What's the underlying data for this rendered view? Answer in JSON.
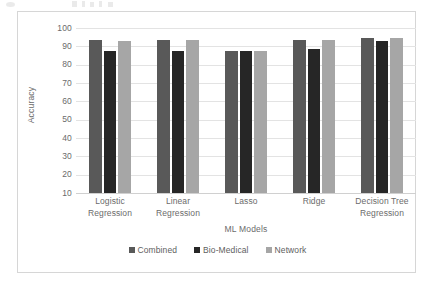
{
  "chart_data": {
    "type": "bar",
    "title": "",
    "xlabel": "ML Models",
    "ylabel": "Accuracy",
    "ylim": [
      10,
      100
    ],
    "yticks": [
      100,
      90,
      80,
      70,
      60,
      50,
      40,
      30,
      20,
      10
    ],
    "grid": true,
    "legend_position": "bottom",
    "categories": [
      "Logistic Regression",
      "Linear Regression",
      "Lasso",
      "Ridge",
      "Decision Tree Regression"
    ],
    "category_lines": [
      [
        "Logistic",
        "Regression"
      ],
      [
        "Linear",
        "Regression"
      ],
      [
        "Lasso",
        ""
      ],
      [
        "Ridge",
        ""
      ],
      [
        "Decision Tree",
        "Regression"
      ]
    ],
    "series": [
      {
        "name": "Combined",
        "color": "#595959",
        "values": [
          93.5,
          93.5,
          87.5,
          93.7,
          94.8
        ]
      },
      {
        "name": "Bio-Medical",
        "color": "#262626",
        "values": [
          87.5,
          87.5,
          87.5,
          88.5,
          92.8
        ]
      },
      {
        "name": "Network",
        "color": "#a6a6a6",
        "values": [
          93.0,
          93.5,
          87.5,
          93.7,
          94.3
        ]
      }
    ]
  },
  "axis": {
    "y_title": "Accuracy",
    "x_title": "ML Models",
    "y_ticks": [
      "100",
      "90",
      "80",
      "70",
      "60",
      "50",
      "40",
      "30",
      "20",
      "10"
    ]
  },
  "legend": {
    "items": [
      {
        "label": "Combined",
        "color": "#595959"
      },
      {
        "label": "Bio-Medical",
        "color": "#262626"
      },
      {
        "label": "Network",
        "color": "#a6a6a6"
      }
    ]
  }
}
